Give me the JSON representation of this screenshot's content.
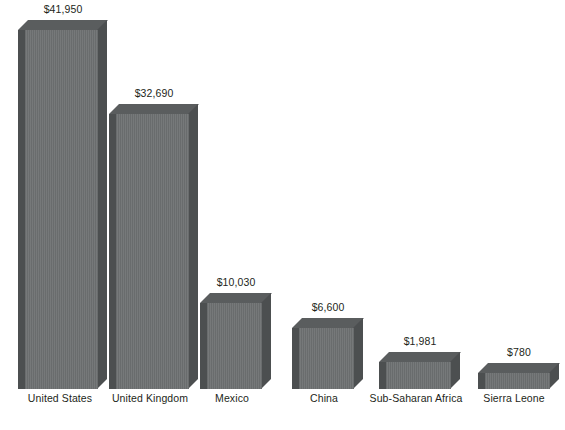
{
  "chart_data": {
    "type": "bar",
    "title": "",
    "subtitle": "",
    "xlabel": "",
    "ylabel": "",
    "grid": false,
    "legend": "none",
    "style": "3d-bars",
    "ylim": [
      0,
      41950
    ],
    "categories": [
      "United States",
      "United Kingdom",
      "Mexico",
      "China",
      "Sub-Saharan Africa",
      "Sierra Leone"
    ],
    "values": [
      41950,
      32690,
      10030,
      6600,
      1981,
      780
    ],
    "value_labels": [
      "$41,950",
      "$32,690",
      "$10,030",
      "$6,600",
      "$1,981",
      "$780"
    ],
    "bar_color": "#6e7172",
    "bar_shadow_color": "#4c4f50",
    "bar_top_color": "#5a5d5e",
    "background": "#ffffff",
    "text_color": "#231f20",
    "bars": [
      {
        "label": "United States",
        "value": 41950,
        "value_label": "$41,950",
        "x": 18,
        "width": 80,
        "height": 359,
        "label_x": 14,
        "label_w": 92
      },
      {
        "label": "United Kingdom",
        "value": 32690,
        "value_label": "$32,690",
        "x": 109,
        "width": 80,
        "height": 275,
        "label_x": 103,
        "label_w": 94
      },
      {
        "label": "Mexico",
        "value": 10030,
        "value_label": "$10,030",
        "x": 200,
        "width": 62,
        "height": 86,
        "label_x": 193,
        "label_w": 78
      },
      {
        "label": "China",
        "value": 6600,
        "value_label": "$6,600",
        "x": 292,
        "width": 62,
        "height": 61,
        "label_x": 285,
        "label_w": 78
      },
      {
        "label": "Sub-Saharan Africa",
        "value": 1981,
        "value_label": "$1,981",
        "x": 379,
        "width": 72,
        "height": 27,
        "label_x": 368,
        "label_w": 96
      },
      {
        "label": "Sierra Leone",
        "value": 780,
        "value_label": "$780",
        "x": 478,
        "width": 72,
        "height": 16,
        "label_x": 470,
        "label_w": 88
      }
    ]
  }
}
